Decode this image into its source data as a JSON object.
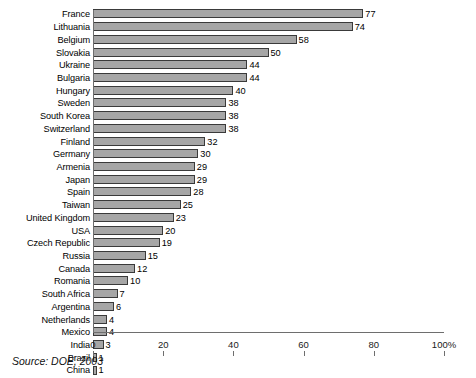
{
  "chart_data": {
    "type": "bar",
    "orientation": "horizontal",
    "title": "",
    "subtitle": "",
    "xlabel": "",
    "ylabel": "",
    "xlim": [
      0,
      100
    ],
    "grid": false,
    "legend": null,
    "axis_unit": "%",
    "xticks": [
      {
        "value": 0,
        "label": "0"
      },
      {
        "value": 20,
        "label": "20"
      },
      {
        "value": 40,
        "label": "40"
      },
      {
        "value": 60,
        "label": "60"
      },
      {
        "value": 80,
        "label": "80"
      },
      {
        "value": 100,
        "label": "100%"
      }
    ],
    "categories": [
      "France",
      "Lithuania",
      "Belgium",
      "Slovakia",
      "Ukraine",
      "Bulgaria",
      "Hungary",
      "Sweden",
      "South Korea",
      "Switzerland",
      "Finland",
      "Germany",
      "Armenia",
      "Japan",
      "Spain",
      "Taiwan",
      "United Kingdom",
      "USA",
      "Czech Republic",
      "Russia",
      "Canada",
      "Romania",
      "South Africa",
      "Argentina",
      "Netherlands",
      "Mexico",
      "India",
      "Brazil",
      "China"
    ],
    "values": [
      77,
      74,
      58,
      50,
      44,
      44,
      40,
      38,
      38,
      38,
      32,
      30,
      29,
      29,
      28,
      25,
      23,
      20,
      19,
      15,
      12,
      10,
      7,
      6,
      4,
      4,
      3,
      1,
      1
    ],
    "bars": [
      {
        "category": "France",
        "value": 77,
        "label": "77"
      },
      {
        "category": "Lithuania",
        "value": 74,
        "label": "74"
      },
      {
        "category": "Belgium",
        "value": 58,
        "label": "58"
      },
      {
        "category": "Slovakia",
        "value": 50,
        "label": "50"
      },
      {
        "category": "Ukraine",
        "value": 44,
        "label": "44"
      },
      {
        "category": "Bulgaria",
        "value": 44,
        "label": "44"
      },
      {
        "category": "Hungary",
        "value": 40,
        "label": "40"
      },
      {
        "category": "Sweden",
        "value": 38,
        "label": "38"
      },
      {
        "category": "South Korea",
        "value": 38,
        "label": "38"
      },
      {
        "category": "Switzerland",
        "value": 38,
        "label": "38"
      },
      {
        "category": "Finland",
        "value": 32,
        "label": "32"
      },
      {
        "category": "Germany",
        "value": 30,
        "label": "30"
      },
      {
        "category": "Armenia",
        "value": 29,
        "label": "29"
      },
      {
        "category": "Japan",
        "value": 29,
        "label": "29"
      },
      {
        "category": "Spain",
        "value": 28,
        "label": "28"
      },
      {
        "category": "Taiwan",
        "value": 25,
        "label": "25"
      },
      {
        "category": "United Kingdom",
        "value": 23,
        "label": "23"
      },
      {
        "category": "USA",
        "value": 20,
        "label": "20"
      },
      {
        "category": "Czech Republic",
        "value": 19,
        "label": "19"
      },
      {
        "category": "Russia",
        "value": 15,
        "label": "15"
      },
      {
        "category": "Canada",
        "value": 12,
        "label": "12"
      },
      {
        "category": "Romania",
        "value": 10,
        "label": "10"
      },
      {
        "category": "South Africa",
        "value": 7,
        "label": "7"
      },
      {
        "category": "Argentina",
        "value": 6,
        "label": "6"
      },
      {
        "category": "Netherlands",
        "value": 4,
        "label": "4"
      },
      {
        "category": "Mexico",
        "value": 4,
        "label": "4"
      },
      {
        "category": "India",
        "value": 3,
        "label": "3"
      },
      {
        "category": "Brazil",
        "value": 1,
        "label": "1"
      },
      {
        "category": "China",
        "value": 1,
        "label": "1"
      }
    ],
    "colors": {
      "bar_fill": "#a6a6a6",
      "bar_border": "#3a3a3a",
      "axis": "#6e6e6e",
      "text": "#000000",
      "background": "#ffffff"
    }
  },
  "caption": {
    "source_note": "Source: DOE, 2003"
  }
}
